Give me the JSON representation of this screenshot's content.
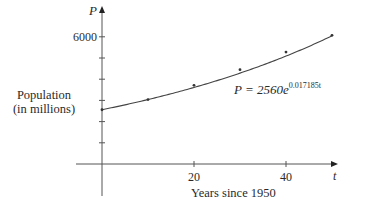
{
  "chart_data": {
    "type": "scatter",
    "title": "",
    "xlabel": "Years since 1950",
    "ylabel": "Population\n(in millions)",
    "ylabel_lines": [
      "Population",
      "(in millions)"
    ],
    "x_axis_var": "t",
    "y_axis_var": "P",
    "xlim": [
      0,
      50
    ],
    "ylim": [
      0,
      6000
    ],
    "x_ticks": [
      10,
      20,
      30,
      40,
      50
    ],
    "x_tick_labels": [
      "20",
      "40"
    ],
    "y_ticks": [
      1000,
      2000,
      3000,
      4000,
      5000,
      6000
    ],
    "y_tick_labels": [
      "6000"
    ],
    "grid": false,
    "legend": null,
    "series": [
      {
        "name": "Data points",
        "type": "scatter",
        "x": [
          0,
          10,
          20,
          30,
          40,
          50
        ],
        "y": [
          2560,
          3040,
          3710,
          4450,
          5280,
          6070
        ]
      },
      {
        "name": "Exponential model",
        "type": "line",
        "equation": "P = 2560e^(0.017185t)",
        "a": 2560,
        "k": 0.017185,
        "x_range": [
          0,
          50
        ]
      }
    ],
    "annotations": [
      {
        "text_base": "P = 2560e",
        "text_exp": "0.017185t",
        "x": 30,
        "y": 3650
      }
    ]
  },
  "labels": {
    "y_var": "P",
    "x_var": "t",
    "y_tick_6000": "6000",
    "x_tick_20": "20",
    "x_tick_40": "40",
    "ylabel_line1": "Population",
    "ylabel_line2": "(in millions)",
    "xlabel": "Years since 1950",
    "equation_base": "P = 2560e",
    "equation_exp": "0.017185t"
  },
  "colors": {
    "axis": "#555555",
    "curve": "#444444",
    "points": "#333333",
    "text": "#2a2a2a"
  }
}
